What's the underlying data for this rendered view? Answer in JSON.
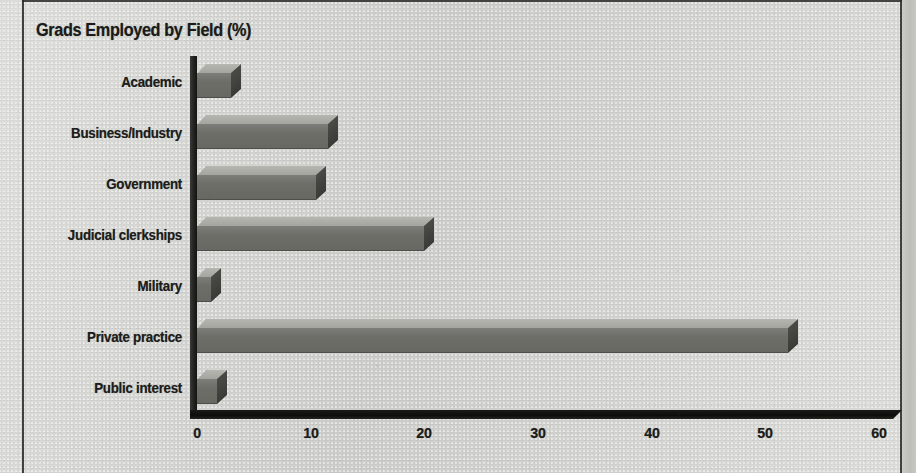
{
  "chart_data": {
    "type": "bar",
    "orientation": "horizontal",
    "title": "Grads Employed by Field (%)",
    "xlabel": "",
    "ylabel": "",
    "xlim": [
      0,
      60
    ],
    "xticks": [
      "0",
      "10",
      "20",
      "30",
      "40",
      "50",
      "60"
    ],
    "grid": false,
    "legend": null,
    "categories": [
      "Academic",
      "Business/Industry",
      "Government",
      "Judicial clerkships",
      "Military",
      "Private practice",
      "Public interest"
    ],
    "values": [
      3,
      11.5,
      10.5,
      20,
      1.2,
      52,
      1.8
    ],
    "bar_style": "3d-extruded-grayscale",
    "colors": {
      "bar_front": "#6e6e69",
      "bar_top": "#aeaea8",
      "bar_side": "#3f3f3b",
      "axis": "#141410",
      "text": "#1d1d1b",
      "background": "#d6d6d3"
    }
  },
  "frame": {
    "left_rule": "vertical-rule",
    "top_rule": "horizontal-rule",
    "right_rule": "vertical-rule"
  }
}
